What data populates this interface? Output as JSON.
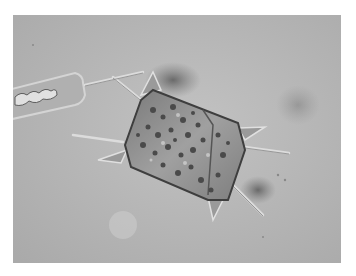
{
  "image": {
    "subject": "diatom-micrograph",
    "description": "Grayscale light micrograph of a box-shaped diatom with horn-like projections and long spines, adjacent to a narrow elongated cell",
    "colors": {
      "background": "#b8b8b8",
      "cell_body": "#8e8e8e",
      "dark_granules": "#4a4a4a",
      "border": "#ffffff"
    }
  }
}
